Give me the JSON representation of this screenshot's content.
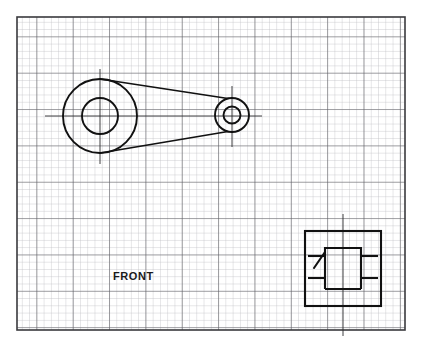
{
  "drawing": {
    "title": "Mechanical part sketch on graph paper",
    "medium": "grid-paper-sketch",
    "labels": {
      "front_view": "FRONT"
    },
    "colors": {
      "paper": "#ffffff",
      "grid_minor": "#b9b9bd",
      "grid_major": "#5a5a60",
      "frame": "#3a3a3e",
      "ink": "#111111"
    },
    "sheet": {
      "frame_x": 17,
      "frame_y": 17,
      "frame_width": 388,
      "frame_height": 313,
      "grid_cell_px": 7.27,
      "grid_major_every": 5
    },
    "views": [
      {
        "name": "front-view",
        "label": "FRONT",
        "type": "crank-lever-arm",
        "big_boss": {
          "center_x": 100,
          "center_y": 116,
          "outer_radius": 37,
          "inner_radius": 18,
          "centerline_h": [
            45,
            160
          ],
          "centerline_v": [
            69,
            164
          ]
        },
        "small_boss": {
          "center_x": 232,
          "center_y": 115,
          "outer_radius": 17,
          "inner_radius": 8.5,
          "centerline_h": [
            196,
            262
          ],
          "centerline_v": [
            86,
            147
          ]
        },
        "web_tangents": [
          {
            "x1": 100,
            "y1": 79,
            "x2": 226,
            "y2": 98.5
          },
          {
            "x1": 100,
            "y1": 153,
            "x2": 226,
            "y2": 131.5
          }
        ]
      },
      {
        "name": "detail-view",
        "type": "section-detail",
        "outer_square": {
          "x": 305,
          "y": 231,
          "width": 76,
          "height": 75
        },
        "inner_channel": {
          "x": 325,
          "y": 248,
          "width": 36,
          "height": 41
        },
        "centerline_v": [
          214,
          336
        ],
        "centerline_x": 343,
        "tabs": [
          {
            "name": "tab-left-upper",
            "x1": 308,
            "y1": 256,
            "x2": 325,
            "y2": 256
          },
          {
            "name": "tab-right-upper",
            "x1": 361,
            "y1": 256,
            "x2": 378,
            "y2": 256
          },
          {
            "name": "tab-left-lower",
            "x1": 308,
            "y1": 278,
            "x2": 325,
            "y2": 278
          },
          {
            "name": "tab-right-lower",
            "x1": 361,
            "y1": 278,
            "x2": 378,
            "y2": 278
          }
        ],
        "leader_tick": {
          "x1": 315,
          "y1": 266,
          "x2": 325,
          "y2": 253
        }
      }
    ]
  }
}
